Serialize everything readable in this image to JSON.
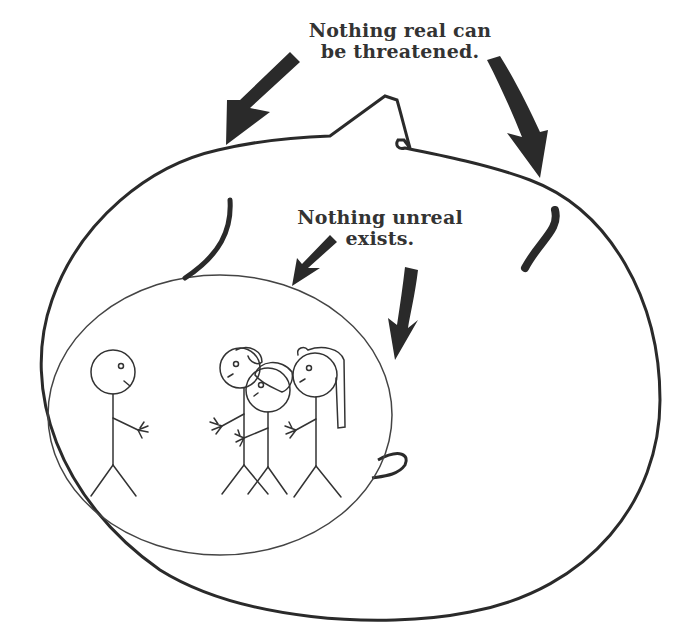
{
  "captions": {
    "outer": {
      "line1": "Nothing real can",
      "line2": "be threatened."
    },
    "inner": {
      "line1": "Nothing unreal",
      "line2": "exists."
    }
  },
  "figures": {
    "outer_shape": "large ellipse with head bump (the real self)",
    "inner_shape": "small ellipse containing stick figures (the unreal world)",
    "stick_figures": [
      {
        "name": "lone-figure",
        "description": "single stick figure facing right"
      },
      {
        "name": "group-figure-1",
        "description": "stick figure with short hair"
      },
      {
        "name": "group-figure-2",
        "description": "stick figure with bowl hair"
      },
      {
        "name": "group-figure-3",
        "description": "stick figure with ponytail"
      }
    ]
  },
  "colors": {
    "ink": "#2a2a2a",
    "background": "#ffffff"
  }
}
